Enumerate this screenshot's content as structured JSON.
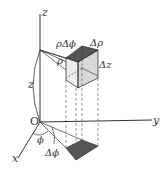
{
  "diagram": {
    "type": "cylindrical-volume-element",
    "axes": {
      "z": "z",
      "y": "y",
      "x": "x",
      "origin": "O"
    },
    "labels": {
      "rho_dphi": "ρΔϕ",
      "d_rho": "Δρ",
      "d_z": "Δz",
      "rho": "ρ",
      "z_height": "z",
      "phi": "ϕ",
      "d_phi": "Δϕ"
    },
    "colors": {
      "line": "#333333",
      "top_face": "#555555",
      "side_face": "#d8d8d8",
      "base_patch": "#555555"
    }
  }
}
